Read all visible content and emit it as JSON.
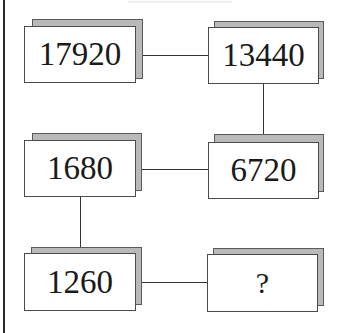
{
  "puzzle": {
    "boxes": [
      {
        "id": "top-left",
        "value": "17920"
      },
      {
        "id": "top-right",
        "value": "13440"
      },
      {
        "id": "middle-left",
        "value": "1680"
      },
      {
        "id": "middle-right",
        "value": "6720"
      },
      {
        "id": "bottom-left",
        "value": "1260"
      },
      {
        "id": "bottom-right",
        "value": "?"
      }
    ],
    "sequence_order": [
      "17920",
      "13440",
      "6720",
      "1680",
      "1260",
      "?"
    ]
  },
  "colors": {
    "shadow_fill": "#b9b9b9",
    "box_border": "#4a4a4a",
    "connector": "#333333"
  }
}
